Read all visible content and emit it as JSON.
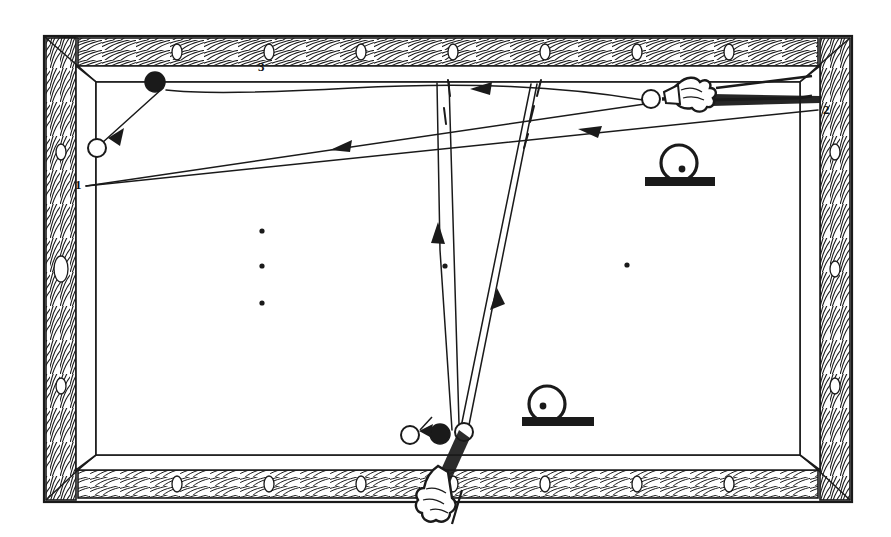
{
  "figure": {
    "kind": "billiards-shot-diagram",
    "ink_color": "#1a1a1a",
    "cloth_color": "#ffffff",
    "rail_color": "#ffffff"
  },
  "labels": {
    "cushion_1": "1",
    "cushion_2": "2",
    "cushion_3": "3"
  },
  "table": {
    "outer_frame": {
      "x": 44,
      "y": 36,
      "w": 808,
      "h": 466
    },
    "playing_surface": {
      "x": 78,
      "y": 72,
      "w": 740,
      "h": 394
    },
    "rail_diamonds": {
      "top_count": 7,
      "bottom_count": 7,
      "left_count": 3,
      "right_count": 3
    }
  },
  "balls": [
    {
      "name": "object-ball-top-left",
      "fill": "black",
      "cx": 155,
      "cy": 82,
      "r": 10
    },
    {
      "name": "target-ball-top-left",
      "fill": "white",
      "cx": 97,
      "cy": 148,
      "r": 9
    },
    {
      "name": "cue-ball-upper-right",
      "fill": "white",
      "cx": 651,
      "cy": 99,
      "r": 9
    },
    {
      "name": "target-ball-bottom-left",
      "fill": "white",
      "cx": 410,
      "cy": 435,
      "r": 9
    },
    {
      "name": "object-ball-bottom",
      "fill": "black",
      "cx": 440,
      "cy": 434,
      "r": 10
    },
    {
      "name": "cue-ball-bottom",
      "fill": "white",
      "cx": 464,
      "cy": 432,
      "r": 9
    }
  ],
  "table_spots": [
    {
      "cx": 262,
      "cy": 231
    },
    {
      "cx": 262,
      "cy": 266
    },
    {
      "cx": 262,
      "cy": 303
    },
    {
      "cx": 445,
      "cy": 266
    },
    {
      "cx": 627,
      "cy": 265
    }
  ],
  "english_indicators": [
    {
      "name": "english-indicator-upper",
      "cx": 679,
      "cy": 163,
      "r": 18,
      "dot_dx": 3,
      "dot_dy": 6,
      "bar": {
        "x": 645,
        "y": 177,
        "w": 70,
        "h": 9
      }
    },
    {
      "name": "english-indicator-lower",
      "cx": 547,
      "cy": 404,
      "r": 18,
      "dot_dx": -4,
      "dot_dy": 2,
      "bar": {
        "x": 522,
        "y": 417,
        "w": 72,
        "h": 9
      }
    }
  ],
  "cues": [
    {
      "name": "cue-stick-upper",
      "hand_x": 700,
      "hand_y": 97,
      "angle_deg": 2
    },
    {
      "name": "cue-stick-lower",
      "hand_x": 450,
      "hand_y": 490,
      "angle_deg": 66
    }
  ],
  "shot_paths": [
    {
      "name": "path-cueball-to-cushion1",
      "desc": "cue ball travels left to cushion 1"
    },
    {
      "name": "path-cushion1-to-cushion2",
      "desc": "rebound from cushion 1 to cushion 2"
    },
    {
      "name": "path-blackball-sweep",
      "desc": "object ball curve along top rail"
    },
    {
      "name": "path-blackball-to-target",
      "desc": "black ball to white ball, top left"
    },
    {
      "name": "path-bottom-up-left",
      "desc": "bottom cue ball up to top cushion"
    },
    {
      "name": "path-bottom-down-right",
      "desc": "return down to bottom object ball"
    }
  ]
}
